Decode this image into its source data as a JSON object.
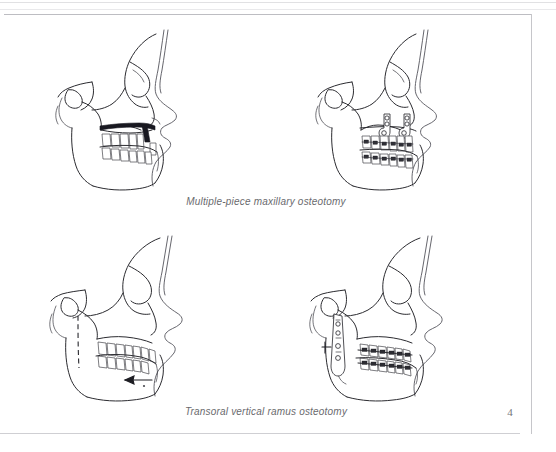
{
  "document": {
    "page_number": "4",
    "page_background": "#ffffff",
    "ink_color": "#2b2b30",
    "caption_color": "#6a6a6e"
  },
  "figures": {
    "rows": [
      {
        "caption": "Multiple-piece maxillary osteotomy",
        "panels": [
          {
            "position": "top-left",
            "name": "multiple-piece-maxillary-osteotomy-preop",
            "description": "Lateral cephalometric tracing showing Le Fort I osteotomy cut with interdental vertical segment",
            "markings": [
              "maxillary-osteotomy-cut-band",
              "interdental-vertical-cut"
            ]
          },
          {
            "position": "top-right",
            "name": "multiple-piece-maxillary-osteotomy-postop",
            "description": "Lateral cephalometric tracing showing rigid fixation plates and orthodontic appliances after maxillary repositioning",
            "markings": [
              "l-shaped-bone-plate-anterior",
              "l-shaped-bone-plate-posterior",
              "orthodontic-brackets",
              "archwire"
            ]
          }
        ]
      },
      {
        "caption": "Transoral vertical ramus osteotomy",
        "panels": [
          {
            "position": "bottom-left",
            "name": "transoral-vertical-ramus-osteotomy-preop",
            "description": "Lateral cephalometric tracing with dashed vertical ramus osteotomy line and setback direction arrow",
            "markings": [
              "vertical-ramus-cut-dashed-line",
              "mandibular-setback-arrow"
            ]
          },
          {
            "position": "bottom-right",
            "name": "transoral-vertical-ramus-osteotomy-postop",
            "description": "Lateral cephalometric tracing showing ramus bone plate with screws and orthodontic archwires after mandibular setback",
            "markings": [
              "ramus-bone-plate",
              "fixation-screws",
              "maxillary-archwire",
              "mandibular-archwire"
            ]
          }
        ]
      }
    ]
  }
}
